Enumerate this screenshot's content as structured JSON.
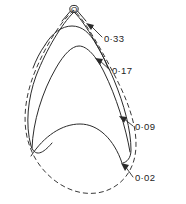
{
  "figure": {
    "background_color": "#ffffff",
    "stroke_color": "#2b2b2b",
    "apex": {
      "label": "O",
      "marker": "small-circle",
      "x": 74,
      "y": 9
    },
    "annotations": [
      {
        "id": "contour-033",
        "label": "0·33",
        "value": 0.33,
        "label_x": 104,
        "label_y": 42,
        "arrow_tip_x": 87,
        "arrow_tip_y": 24,
        "arrow_tail_x": 102,
        "arrow_tail_y": 37
      },
      {
        "id": "contour-017",
        "label": "0·17",
        "value": 0.17,
        "label_x": 112,
        "label_y": 74,
        "arrow_tip_x": 96,
        "arrow_tip_y": 59,
        "arrow_tail_x": 110,
        "arrow_tail_y": 70
      },
      {
        "id": "contour-009",
        "label": "0·09",
        "value": 0.09,
        "label_x": 135,
        "label_y": 130,
        "arrow_tip_x": 120,
        "arrow_tip_y": 117,
        "arrow_tail_x": 133,
        "arrow_tail_y": 126
      },
      {
        "id": "contour-002",
        "label": "0·02",
        "value": 0.02,
        "label_x": 135,
        "label_y": 181,
        "arrow_tip_x": 122,
        "arrow_tip_y": 164,
        "arrow_tail_x": 133,
        "arrow_tail_y": 177
      }
    ],
    "curves": [
      {
        "id": "envelope-teardrop",
        "style": "dashed",
        "description": "outer dashed teardrop envelope closing at apex O"
      },
      {
        "id": "contour-033-curve",
        "style": "solid",
        "description": "innermost solid arc nearest the apex"
      },
      {
        "id": "contour-017-curve",
        "style": "solid",
        "description": "middle solid arc"
      },
      {
        "id": "contour-009-curve",
        "style": "solid",
        "description": "outer solid arc tracing the teardrop flanks"
      },
      {
        "id": "contour-002-curve",
        "style": "solid",
        "description": "lower solid lens arc spanning the teardrop width"
      }
    ]
  }
}
